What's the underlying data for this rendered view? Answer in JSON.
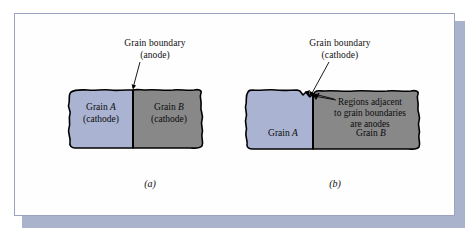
{
  "figure": {
    "panels": [
      {
        "id": "a",
        "caption": "(a)",
        "callout_line1": "Grain boundary",
        "callout_line2": "(anode)",
        "grains": [
          {
            "name_prefix": "Grain ",
            "name_letter": "A",
            "role": "(cathode)",
            "fill": "#aab4d2"
          },
          {
            "name_prefix": "Grain ",
            "name_letter": "B",
            "role": "(cathode)",
            "fill": "#888888"
          }
        ]
      },
      {
        "id": "b",
        "caption": "(b)",
        "callout_line1": "Grain boundary",
        "callout_line2": "(cathode)",
        "note_line1": "Regions adjacent",
        "note_line2": "to grain boundaries",
        "note_line3": "are anodes",
        "grains": [
          {
            "name_prefix": "Grain ",
            "name_letter": "A",
            "role": "",
            "fill": "#aab4d2"
          },
          {
            "name_prefix": "Grain ",
            "name_letter": "B",
            "role": "",
            "fill": "#888888"
          }
        ]
      }
    ]
  },
  "colors": {
    "grain_a_fill": "#aab4d2",
    "grain_b_fill": "#888888",
    "outline": "#000000",
    "frame_border": "#9aa3c0",
    "frame_shadow": "#8e99bb",
    "page_background": "#ffffff"
  }
}
